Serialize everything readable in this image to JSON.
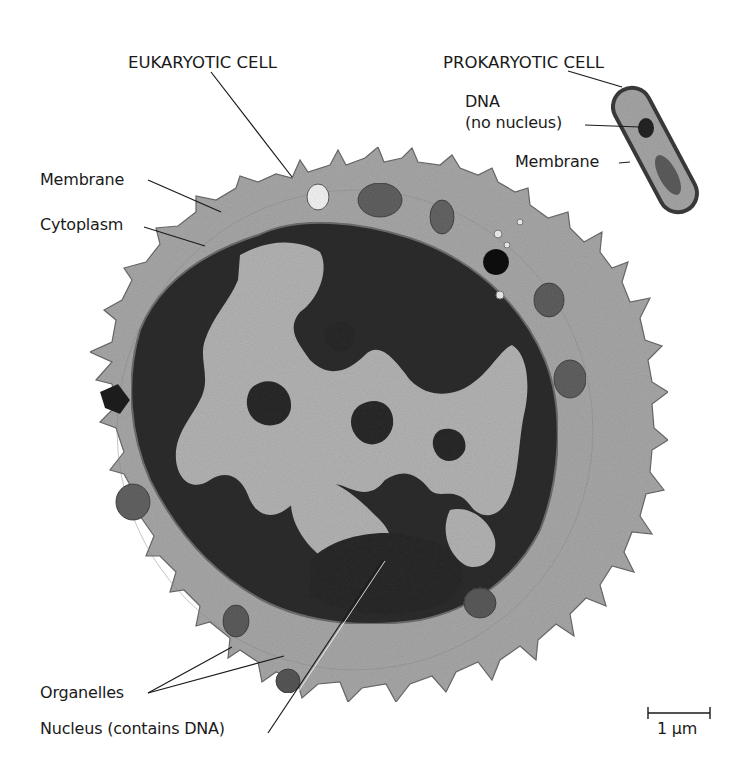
{
  "figure": {
    "type": "electron micrograph comparison",
    "background": "#ffffff",
    "colors": {
      "cytoplasm": "#a9a9a9",
      "nucleus_dark": "#2b2b2b",
      "nucleus_light": "#b4b4b4",
      "organelle": "#6e6e6e",
      "line": "#1a1a1a"
    }
  },
  "labels": {
    "eukaryotic_cell": "EUKARYOTIC CELL",
    "prokaryotic_cell": "PROKARYOTIC CELL",
    "euk_membrane": "Membrane",
    "cytoplasm": "Cytoplasm",
    "dna": "DNA",
    "no_nucleus": "(no nucleus)",
    "prok_membrane": "Membrane",
    "organelles": "Organelles",
    "nucleus": "Nucleus (contains DNA)"
  },
  "scale_bar": {
    "label": "1 µm"
  }
}
